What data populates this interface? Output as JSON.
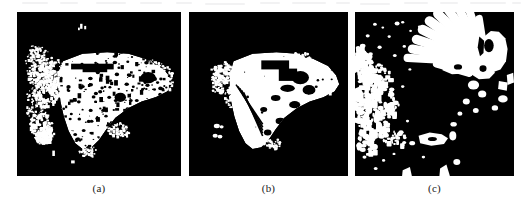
{
  "figure": {
    "type": "image-panel-figure",
    "background_color": "#ffffff",
    "panel_background_color": "#000000",
    "panel_foreground_color": "#ffffff",
    "panel_count": 3,
    "panels": [
      {
        "id": "panel-a",
        "caption": "(a)",
        "x": 17,
        "y": 12,
        "width": 164,
        "height": 164,
        "description": "noisy speckled binary mask of butterfly wing"
      },
      {
        "id": "panel-b",
        "caption": "(b)",
        "x": 189,
        "y": 12,
        "width": 159,
        "height": 164,
        "description": "cleaned solid binary mask of butterfly wing"
      },
      {
        "id": "panel-c",
        "caption": "(c)",
        "x": 355,
        "y": 12,
        "width": 159,
        "height": 164,
        "description": "binary mask showing radiating wing vein cell structure"
      }
    ]
  },
  "captions": {
    "a": "(a)",
    "b": "(b)",
    "c": "(c)"
  }
}
